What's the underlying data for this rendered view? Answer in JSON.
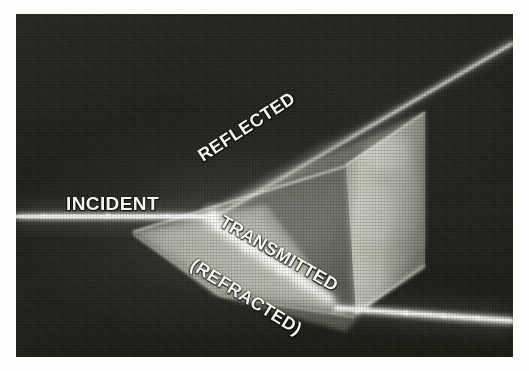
{
  "figure": {
    "kind": "photograph",
    "background_color": "#ffffff",
    "photo_background_color": "#1b1b17"
  },
  "labels": {
    "incident": "INCIDENT",
    "reflected": "REFLECTED",
    "transmitted": "TRANSMITTED",
    "refracted": "(REFRACTED)",
    "text_color": "#f4f4ee"
  },
  "beams": {
    "incident_beam": {
      "name": "incident-beam",
      "color": "#fffdf0",
      "direction": "horizontal from left edge to prism face"
    },
    "reflected_beam": {
      "name": "reflected-beam",
      "color": "#efeee2",
      "direction": "upward to the right from the prism face"
    },
    "transmitted_beam": {
      "name": "transmitted-beam",
      "color": "#fffdf0",
      "direction": "downward to the right exiting the prism"
    },
    "internal_beam": {
      "name": "internal-refracted-beam",
      "color": "#ffffff",
      "direction": "bent inside the glass prism"
    }
  },
  "prism": {
    "name": "glass-prism",
    "face_left_color": "#b9b9ae",
    "face_right_color": "#cfcfc2",
    "edge_color": "#e8e8dc"
  }
}
